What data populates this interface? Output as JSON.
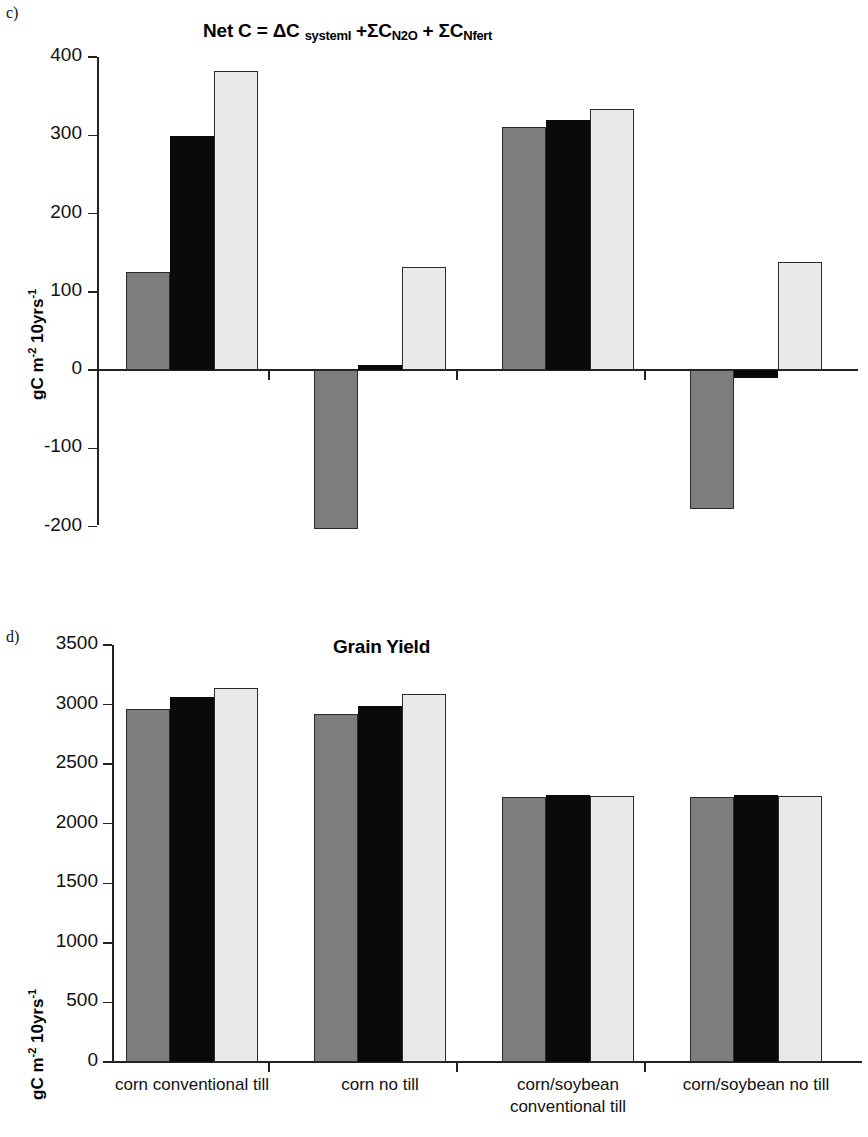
{
  "figure": {
    "panels": [
      {
        "letter": "c)",
        "title_parts": {
          "main": "Net C = ΔC",
          "sub1": "systemI",
          "mid": "+ΣC",
          "sub2": "N2O",
          "mid2": " + ΣC",
          "sub3": "Nfert"
        },
        "title_plain": "Net C = ΔC systemI +ΣC N2O + ΣC Nfert",
        "ylabel": "gC m-2 10yrs-1"
      },
      {
        "letter": "d)",
        "title_plain": "Grain Yield",
        "ylabel": "gC m-2 10yrs-1"
      }
    ]
  },
  "colors": {
    "series1": "#7d7d7d",
    "series2": "#0a0a0a",
    "series3": "#e9e9e9",
    "axis": "#222222",
    "background": "#ffffff"
  },
  "chart_data": [
    {
      "type": "bar",
      "panel": "c",
      "title": "Net C = ΔC systemI +ΣC N2O + ΣC Nfert",
      "xlabel": "",
      "ylabel": "gC m-2 10yrs-1",
      "ylim": [
        -200,
        400
      ],
      "yticks": [
        400,
        300,
        200,
        100,
        0,
        -100,
        -200
      ],
      "ytick_labels": [
        "400",
        "300",
        "200",
        "100",
        "0",
        "-100",
        "-200"
      ],
      "grid": false,
      "legend": "none",
      "categories": [
        "corn conventional till",
        "corn no till",
        "corn/soybean conventional till",
        "corn/soybean no till"
      ],
      "series": [
        {
          "name": "series1",
          "color": "#7d7d7d",
          "values": [
            125,
            -203,
            310,
            -178
          ]
        },
        {
          "name": "series2",
          "color": "#0a0a0a",
          "values": [
            299,
            7,
            320,
            -10
          ]
        },
        {
          "name": "series3",
          "color": "#e9e9e9",
          "values": [
            382,
            131,
            333,
            138
          ]
        }
      ]
    },
    {
      "type": "bar",
      "panel": "d",
      "title": "Grain Yield",
      "xlabel": "",
      "ylabel": "gC m-2 10yrs-1",
      "ylim": [
        0,
        3500
      ],
      "yticks": [
        3500,
        3000,
        2500,
        2000,
        1500,
        1000,
        500,
        0
      ],
      "ytick_labels": [
        "3500",
        "3000",
        "2500",
        "2000",
        "1500",
        "1000",
        "500",
        "0"
      ],
      "grid": false,
      "legend": "none",
      "categories": [
        "corn conventional till",
        "corn no till",
        "corn/soybean conventional till",
        "corn/soybean no till"
      ],
      "series": [
        {
          "name": "series1",
          "color": "#7d7d7d",
          "values": [
            2965,
            2925,
            2225,
            2225
          ]
        },
        {
          "name": "series2",
          "color": "#0a0a0a",
          "values": [
            3060,
            2990,
            2245,
            2245
          ]
        },
        {
          "name": "series3",
          "color": "#e9e9e9",
          "values": [
            3140,
            3085,
            2235,
            2235
          ]
        }
      ]
    }
  ],
  "xaxis_labels": [
    {
      "line1": "corn conventional till",
      "line2": ""
    },
    {
      "line1": "corn no till",
      "line2": ""
    },
    {
      "line1": "corn/soybean",
      "line2": "conventional till"
    },
    {
      "line1": "corn/soybean no till",
      "line2": ""
    }
  ]
}
